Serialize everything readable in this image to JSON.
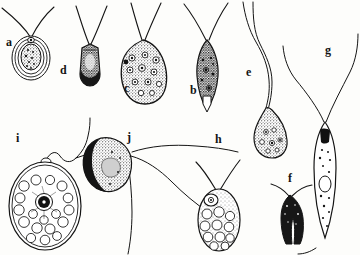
{
  "figure": {
    "kind": "scientific-plate-line-drawing",
    "background_color": "#fdfdfb",
    "ink_color": "#141414",
    "width": 360,
    "height": 255
  },
  "labels": [
    {
      "id": "a",
      "text": "a",
      "x": 6,
      "y": 36
    },
    {
      "id": "d",
      "text": "d",
      "x": 60,
      "y": 64
    },
    {
      "id": "c",
      "text": "c",
      "x": 124,
      "y": 82
    },
    {
      "id": "b",
      "text": "b",
      "x": 190,
      "y": 84
    },
    {
      "id": "e",
      "text": "e",
      "x": 246,
      "y": 66
    },
    {
      "id": "g",
      "text": "g",
      "x": 325,
      "y": 44
    },
    {
      "id": "i",
      "text": "i",
      "x": 16,
      "y": 132
    },
    {
      "id": "j",
      "text": "j",
      "x": 127,
      "y": 131
    },
    {
      "id": "h",
      "text": "h",
      "x": 215,
      "y": 133
    },
    {
      "id": "f",
      "text": "f",
      "x": 288,
      "y": 172
    }
  ],
  "organisms": [
    {
      "id": "a",
      "label": "a",
      "description": "small encysted oval cell with concentric cyst walls and granular interior, two flagella emerging from apex",
      "flagella_count": 2,
      "body_shape": "oval-cyst",
      "fill": "stippled",
      "center": {
        "x": 31,
        "y": 57
      }
    },
    {
      "id": "d",
      "label": "d",
      "description": "cylindrical blunt-ended cell, densely stippled, two flagella diverging from apex",
      "flagella_count": 2,
      "body_shape": "cylindrical",
      "fill": "dark-stipple",
      "center": {
        "x": 90,
        "y": 62
      }
    },
    {
      "id": "c",
      "label": "c",
      "description": "broad pear-shaped cell crowded with ring-like vacuoles and dark granules, two flagella",
      "flagella_count": 2,
      "body_shape": "pyriform",
      "fill": "vacuolated-stipple",
      "center": {
        "x": 143,
        "y": 72
      }
    },
    {
      "id": "b",
      "label": "b",
      "description": "spindle-shaped cell tapering to a point, dark granular cytoplasm, two flagella in a V",
      "flagella_count": 2,
      "body_shape": "spindle",
      "fill": "dark-stipple",
      "center": {
        "x": 207,
        "y": 72
      }
    },
    {
      "id": "e",
      "label": "e",
      "description": "elongate comma-shaped cell with a very long undulating flagellum",
      "flagella_count": 1,
      "body_shape": "comma",
      "fill": "stippled",
      "center": {
        "x": 272,
        "y": 120
      }
    },
    {
      "id": "g",
      "label": "g",
      "description": "long slender fusiform cell with internal granules and a clear central vacuole, two long flagella forming a wide V",
      "flagella_count": 2,
      "body_shape": "fusiform-elongate",
      "fill": "stipple-with-vacuole",
      "center": {
        "x": 324,
        "y": 150
      }
    },
    {
      "id": "i",
      "label": "i",
      "description": "large broad-oval cell packed with round vacuoles and a dark central nucleus, single wavy flagellum",
      "flagella_count": 1,
      "body_shape": "broad-oval",
      "fill": "vacuolated",
      "center": {
        "x": 44,
        "y": 205
      }
    },
    {
      "id": "j",
      "label": "j",
      "description": "reniform cell with dark crescent margin and stippled interior, three trailing flagella",
      "flagella_count": 3,
      "body_shape": "reniform",
      "fill": "dark-crescent-stipple",
      "center": {
        "x": 112,
        "y": 166
      }
    },
    {
      "id": "h",
      "label": "h",
      "description": "oval cell with apical nucleus and large vacuoles in lower half, two flagella",
      "flagella_count": 2,
      "body_shape": "oval",
      "fill": "vacuolated",
      "center": {
        "x": 219,
        "y": 215
      }
    },
    {
      "id": "f",
      "label": "f",
      "description": "small dark V-shaped or forked body with two flagella",
      "flagella_count": 2,
      "body_shape": "forked",
      "fill": "solid-dark",
      "center": {
        "x": 290,
        "y": 210
      }
    }
  ]
}
